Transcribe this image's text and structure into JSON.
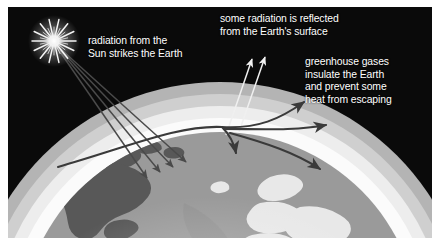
{
  "figure": {
    "background_color": "#0a0a0a",
    "frame_color": "#ffffff",
    "text_color": "#ffffff"
  },
  "captions": {
    "sun": "radiation from the\nSun strikes the Earth",
    "reflected": "some radiation is reflected\nfrom the Earth's surface",
    "greenhouse": "greenhouse gases\ninsulate the Earth\nand prevent some\nheat from escaping"
  },
  "elements": {
    "sun_label": "sun",
    "earth_label": "earth",
    "atmosphere_label": "atmosphere",
    "incoming_rays_label": "incoming solar radiation rays",
    "reflected_arrows_label": "reflected radiation arrows",
    "greenhouse_arrows_label": "trapped heat arrows"
  },
  "colors": {
    "space": "#0a0a0a",
    "atmosphere_outer": "#b4b4b4",
    "atmosphere_mid": "#d8d8d8",
    "atmosphere_inner": "#f2f2f2",
    "ocean": "#9a9a9a",
    "land": "#5a5a5a",
    "glow": "#ffffff",
    "ray": "#4a4a4a",
    "reflected_arrow": "#f0f0f0",
    "greenhouse_arrow": "#3a3a3a"
  }
}
